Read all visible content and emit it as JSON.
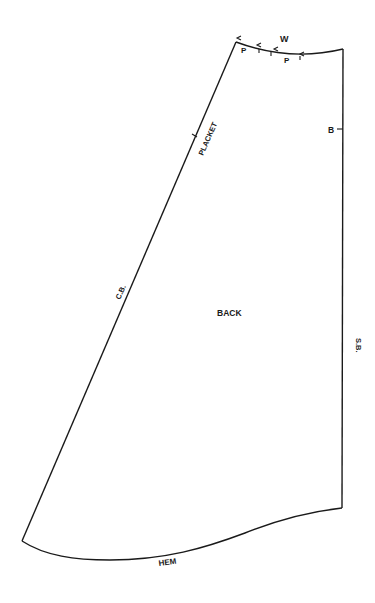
{
  "diagram": {
    "type": "sewing-pattern-piece",
    "piece_label": "BACK",
    "edges": {
      "center_back": "C.B.",
      "side_back": "S.B.",
      "hem": "HEM",
      "waist": "W"
    },
    "markings": {
      "placket": "PLACKET",
      "pleat_left": "P",
      "pleat_right": "P",
      "balance_mark": "B"
    },
    "colors": {
      "line": "#1a1a1a",
      "background": "#ffffff"
    }
  }
}
